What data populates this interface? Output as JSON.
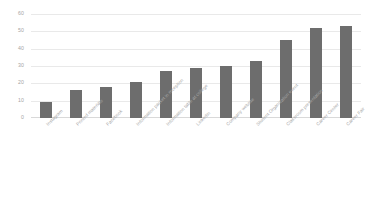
{
  "chart_data": {
    "type": "bar",
    "title": "",
    "subtitle": "",
    "xlabel": "",
    "ylabel": "",
    "ylim": [
      0,
      60
    ],
    "y_ticks": [
      0,
      10,
      20,
      30,
      40,
      50,
      60
    ],
    "grid": true,
    "legend": "none",
    "bar_color": "#6d6d6d",
    "gridline_color": "#e9e9e9",
    "tick_label_color": "#a5a5a5",
    "categories": [
      "Instagram",
      "Printed materials",
      "Facebook",
      "Information packet in reception",
      "Information table at college",
      "LinkedIn",
      "Company website",
      "Student Organization event",
      "Classroom presentation",
      "Career Center",
      "Career Fair"
    ],
    "values": [
      9,
      16,
      18,
      21,
      27,
      29,
      30,
      33,
      45,
      52,
      53
    ]
  }
}
